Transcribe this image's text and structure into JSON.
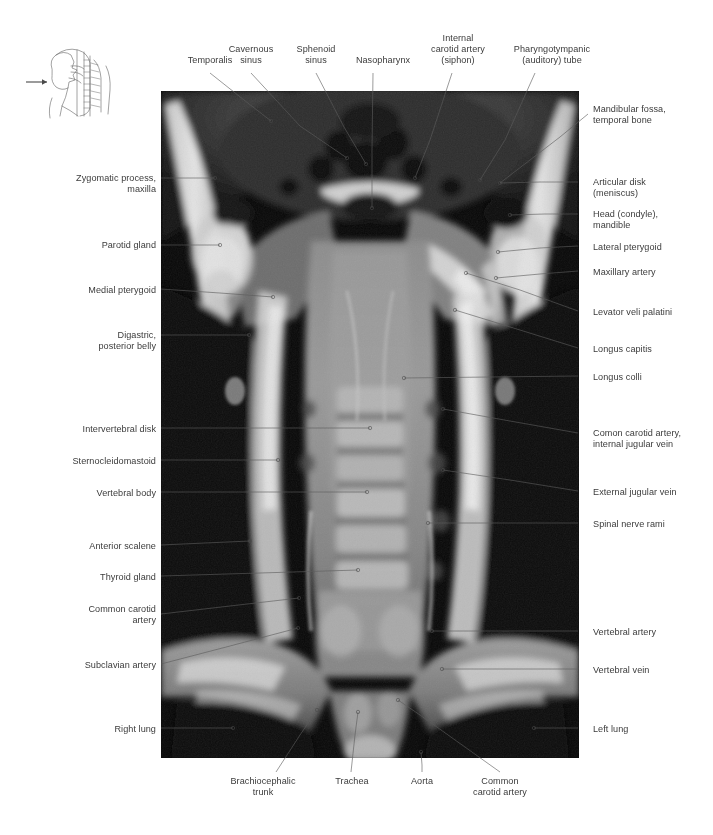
{
  "figure": {
    "type": "anatomical-atlas-plate",
    "modality": "MRI",
    "plane": "coronal",
    "region": "head and neck",
    "orientation_key": {
      "name": "sagittal-head-neck-outline",
      "arrow_direction": "anterior-to-posterior",
      "arrow_glyph": "→"
    },
    "plate_rect": {
      "x": 161,
      "y": 91,
      "w": 418,
      "h": 667
    }
  },
  "labels_top": [
    {
      "text": "Temporalis",
      "x": 167,
      "y": 55,
      "w": 86,
      "align": "c",
      "line": [
        [
          210,
          73
        ],
        [
          244,
          100
        ],
        [
          271,
          121
        ]
      ],
      "dot": [
        271,
        121
      ]
    },
    {
      "text": "Cavernous\nsinus",
      "x": 205,
      "y": 44,
      "w": 92,
      "align": "c",
      "line": [
        [
          251,
          73
        ],
        [
          300,
          126
        ],
        [
          347,
          158
        ]
      ],
      "dot": [
        347,
        158
      ]
    },
    {
      "text": "Sphenoid\nsinus",
      "x": 274,
      "y": 44,
      "w": 84,
      "align": "c",
      "line": [
        [
          316,
          73
        ],
        [
          344,
          127
        ],
        [
          366,
          164
        ]
      ],
      "dot": [
        366,
        164
      ]
    },
    {
      "text": "Nasopharynx",
      "x": 337,
      "y": 55,
      "w": 92,
      "align": "c",
      "line": [
        [
          373,
          73
        ],
        [
          372,
          150
        ],
        [
          372,
          208
        ]
      ],
      "dot": [
        372,
        208
      ]
    },
    {
      "text": "Internal\ncarotid artery\n(siphon)",
      "x": 410,
      "y": 33,
      "w": 96,
      "align": "c",
      "line": [
        [
          452,
          73
        ],
        [
          430,
          140
        ],
        [
          415,
          178
        ]
      ],
      "dot": [
        415,
        178
      ]
    },
    {
      "text": "Pharyngotympanic\n(auditory) tube",
      "x": 492,
      "y": 44,
      "w": 120,
      "align": "c",
      "line": [
        [
          535,
          73
        ],
        [
          505,
          140
        ],
        [
          480,
          180
        ]
      ],
      "dot": [
        480,
        180
      ]
    }
  ],
  "labels_right": [
    {
      "text": "Mandibular fossa,\ntemporal bone",
      "x": 593,
      "y": 104,
      "w": 115,
      "line": [
        [
          588,
          114
        ],
        [
          560,
          137
        ],
        [
          500,
          183
        ]
      ],
      "dot": [
        500,
        183
      ]
    },
    {
      "text": "Articular disk\n(meniscus)",
      "x": 593,
      "y": 177,
      "w": 115,
      "line": [
        [
          578,
          182
        ],
        [
          540,
          182
        ],
        [
          500,
          183
        ]
      ],
      "dot": null
    },
    {
      "text": "Head (condyle),\nmandible",
      "x": 593,
      "y": 209,
      "w": 115,
      "line": [
        [
          578,
          214
        ],
        [
          545,
          214
        ],
        [
          510,
          215
        ]
      ],
      "dot": [
        510,
        215
      ]
    },
    {
      "text": "Lateral pterygoid",
      "x": 593,
      "y": 242,
      "w": 115,
      "line": [
        [
          578,
          246
        ],
        [
          540,
          248
        ],
        [
          498,
          252
        ]
      ],
      "dot": [
        498,
        252
      ]
    },
    {
      "text": "Maxillary artery",
      "x": 593,
      "y": 267,
      "w": 115,
      "line": [
        [
          578,
          271
        ],
        [
          540,
          274
        ],
        [
          496,
          278
        ]
      ],
      "dot": [
        496,
        278
      ]
    },
    {
      "text": "Levator veli palatini",
      "x": 593,
      "y": 307,
      "w": 115,
      "line": [
        [
          578,
          311
        ],
        [
          520,
          290
        ],
        [
          466,
          273
        ]
      ],
      "dot": [
        466,
        273
      ]
    },
    {
      "text": "Longus capitis",
      "x": 593,
      "y": 344,
      "w": 115,
      "line": [
        [
          578,
          348
        ],
        [
          520,
          330
        ],
        [
          455,
          310
        ]
      ],
      "dot": [
        455,
        310
      ]
    },
    {
      "text": "Longus colli",
      "x": 593,
      "y": 372,
      "w": 115,
      "line": [
        [
          578,
          376
        ],
        [
          490,
          377
        ],
        [
          404,
          378
        ]
      ],
      "dot": [
        404,
        378
      ]
    },
    {
      "text": "Comon carotid artery,\ninternal jugular vein",
      "x": 593,
      "y": 428,
      "w": 118,
      "line": [
        [
          578,
          433
        ],
        [
          510,
          421
        ],
        [
          443,
          409
        ]
      ],
      "dot": [
        443,
        409
      ]
    },
    {
      "text": "External jugular vein",
      "x": 593,
      "y": 487,
      "w": 118,
      "line": [
        [
          578,
          491
        ],
        [
          510,
          480
        ],
        [
          443,
          470
        ]
      ],
      "dot": [
        443,
        470
      ]
    },
    {
      "text": "Spinal nerve rami",
      "x": 593,
      "y": 519,
      "w": 118,
      "line": [
        [
          578,
          523
        ],
        [
          500,
          523
        ],
        [
          428,
          523
        ]
      ],
      "dot": [
        428,
        523
      ]
    },
    {
      "text": "Vertebral artery",
      "x": 593,
      "y": 627,
      "w": 118,
      "line": [
        [
          578,
          631
        ],
        [
          505,
          631
        ],
        [
          432,
          631
        ]
      ],
      "dot": [
        432,
        631
      ]
    },
    {
      "text": "Vertebral vein",
      "x": 593,
      "y": 665,
      "w": 118,
      "line": [
        [
          578,
          669
        ],
        [
          510,
          669
        ],
        [
          442,
          669
        ]
      ],
      "dot": [
        442,
        669
      ]
    },
    {
      "text": "Left lung",
      "x": 593,
      "y": 724,
      "w": 118,
      "line": [
        [
          578,
          728
        ],
        [
          555,
          728
        ],
        [
          534,
          728
        ]
      ],
      "dot": [
        534,
        728
      ]
    }
  ],
  "labels_left": [
    {
      "text": "Zygomatic process,\nmaxilla",
      "x": 35,
      "y": 173,
      "w": 121,
      "line": [
        [
          161,
          178
        ],
        [
          185,
          178
        ],
        [
          215,
          178
        ]
      ],
      "dot": [
        215,
        178
      ]
    },
    {
      "text": "Parotid gland",
      "x": 35,
      "y": 240,
      "w": 121,
      "line": [
        [
          161,
          245
        ],
        [
          190,
          245
        ],
        [
          220,
          245
        ]
      ],
      "dot": [
        220,
        245
      ]
    },
    {
      "text": "Medial pterygoid",
      "x": 35,
      "y": 285,
      "w": 121,
      "line": [
        [
          161,
          289
        ],
        [
          220,
          293
        ],
        [
          273,
          297
        ]
      ],
      "dot": [
        273,
        297
      ]
    },
    {
      "text": "Digastric,\nposterior belly",
      "x": 35,
      "y": 330,
      "w": 121,
      "line": [
        [
          161,
          335
        ],
        [
          205,
          335
        ],
        [
          249,
          335
        ]
      ],
      "dot": [
        249,
        335
      ]
    },
    {
      "text": "Intervertebral disk",
      "x": 35,
      "y": 424,
      "w": 121,
      "line": [
        [
          161,
          428
        ],
        [
          265,
          428
        ],
        [
          370,
          428
        ]
      ],
      "dot": [
        370,
        428
      ]
    },
    {
      "text": "Sternocleidomastoid",
      "x": 35,
      "y": 456,
      "w": 121,
      "line": [
        [
          161,
          460
        ],
        [
          220,
          460
        ],
        [
          278,
          460
        ]
      ],
      "dot": [
        278,
        460
      ]
    },
    {
      "text": "Vertebral body",
      "x": 35,
      "y": 488,
      "w": 121,
      "line": [
        [
          161,
          492
        ],
        [
          265,
          492
        ],
        [
          367,
          492
        ]
      ],
      "dot": [
        367,
        492
      ]
    },
    {
      "text": "Anterior scalene",
      "x": 35,
      "y": 541,
      "w": 121,
      "line": [
        [
          161,
          545
        ],
        [
          205,
          543
        ],
        [
          250,
          541
        ]
      ],
      "dot": [
        250,
        541
      ]
    },
    {
      "text": "Thyroid gland",
      "x": 35,
      "y": 572,
      "w": 121,
      "line": [
        [
          161,
          576
        ],
        [
          260,
          573
        ],
        [
          358,
          570
        ]
      ],
      "dot": [
        358,
        570
      ]
    },
    {
      "text": "Common carotid\nartery",
      "x": 35,
      "y": 604,
      "w": 121,
      "line": [
        [
          161,
          614
        ],
        [
          230,
          606
        ],
        [
          299,
          598
        ]
      ],
      "dot": [
        299,
        598
      ]
    },
    {
      "text": "Subclavian artery",
      "x": 35,
      "y": 660,
      "w": 121,
      "line": [
        [
          161,
          664
        ],
        [
          230,
          646
        ],
        [
          298,
          628
        ]
      ],
      "dot": [
        298,
        628
      ]
    },
    {
      "text": "Right lung",
      "x": 35,
      "y": 724,
      "w": 121,
      "line": [
        [
          161,
          728
        ],
        [
          198,
          728
        ],
        [
          233,
          728
        ]
      ],
      "dot": [
        233,
        728
      ]
    }
  ],
  "labels_bottom": [
    {
      "text": "Brachiocephalic\ntrunk",
      "x": 215,
      "y": 776,
      "w": 96,
      "align": "c",
      "line": [
        [
          276,
          772
        ],
        [
          300,
          735
        ],
        [
          317,
          710
        ]
      ],
      "dot": [
        317,
        710
      ]
    },
    {
      "text": "Trachea",
      "x": 320,
      "y": 776,
      "w": 64,
      "align": "c",
      "line": [
        [
          351,
          772
        ],
        [
          355,
          735
        ],
        [
          358,
          712
        ]
      ],
      "dot": [
        358,
        712
      ]
    },
    {
      "text": "Aorta",
      "x": 394,
      "y": 776,
      "w": 56,
      "align": "c",
      "line": [
        [
          422,
          772
        ],
        [
          422,
          765
        ],
        [
          421,
          752
        ]
      ],
      "dot": [
        421,
        752
      ]
    },
    {
      "text": "Common\ncarotid artery",
      "x": 452,
      "y": 776,
      "w": 96,
      "align": "c",
      "line": [
        [
          500,
          772
        ],
        [
          420,
          715
        ],
        [
          398,
          700
        ]
      ],
      "dot": [
        398,
        700
      ]
    }
  ],
  "colors": {
    "text": "#3b3b3b",
    "leader": "#5d5d5d",
    "page_background": "#ffffff",
    "plate_dark": "#0a0a0a",
    "plate_bright": "#f2f2f2"
  }
}
